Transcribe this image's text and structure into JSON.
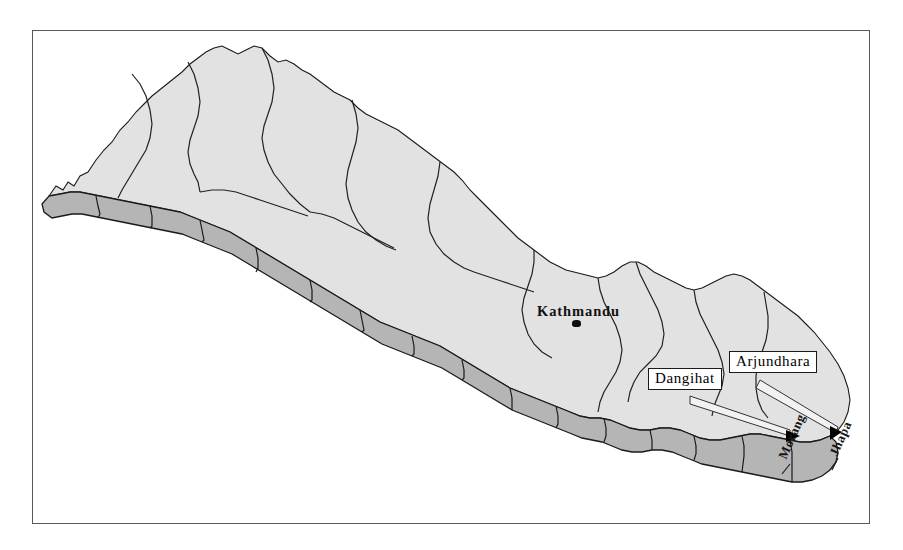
{
  "figure": {
    "type": "map",
    "region": "Nepal",
    "frame": {
      "style": "thin-rectangle-border",
      "color": "#58595b"
    },
    "background_color": "#ffffff"
  },
  "legend_colors": {
    "hill_mountain_fill": "#e2e2e2",
    "terai_fill": "#b5b5b5",
    "boundary_line": "#1a1a1a",
    "marker": "#000000",
    "label_box_fill": "#ffffff",
    "label_box_border": "#1a1a1a"
  },
  "capital": {
    "name": "Kathmandu",
    "marker": "filled-dot"
  },
  "callouts": [
    {
      "label": "Dangihat",
      "marker": "arrowhead"
    },
    {
      "label": "Arjundhara",
      "marker": "arrowhead"
    }
  ],
  "districts": [
    {
      "name": "Morang",
      "orientation": "rotated"
    },
    {
      "name": "Jhapa",
      "orientation": "rotated"
    }
  ]
}
